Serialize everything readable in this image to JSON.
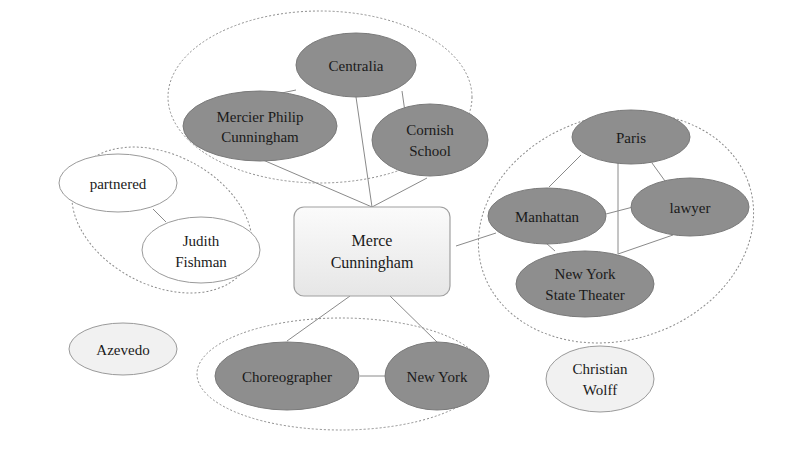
{
  "diagram": {
    "center": {
      "label_line1": "Merce",
      "label_line2": "Cunningham"
    },
    "groups": {
      "top": {
        "nodes": {
          "centralia": {
            "label": "Centralia"
          },
          "mercier": {
            "label_line1": "Mercier Philip",
            "label_line2": "Cunningham"
          },
          "cornish": {
            "label_line1": "Cornish",
            "label_line2": "School"
          }
        }
      },
      "left": {
        "nodes": {
          "partnered": {
            "label": "partnered"
          },
          "judith": {
            "label_line1": "Judith",
            "label_line2": "Fishman"
          }
        }
      },
      "right": {
        "nodes": {
          "paris": {
            "label": "Paris"
          },
          "manhattan": {
            "label": "Manhattan"
          },
          "lawyer": {
            "label": "lawyer"
          },
          "nyst": {
            "label_line1": "New York",
            "label_line2": "State Theater"
          }
        }
      },
      "bottom": {
        "nodes": {
          "choreographer": {
            "label": "Choreographer"
          },
          "newyork": {
            "label": "New York"
          }
        }
      }
    },
    "standalone": {
      "azevedo": {
        "label": "Azevedo"
      },
      "wolff": {
        "label_line1": "Christian",
        "label_line2": "Wolff"
      }
    },
    "colors": {
      "dark_node": "#8e8e8e",
      "light_node": "#ffffff",
      "gray_node": "#f1f1f1",
      "edge": "#8a8a8a"
    }
  }
}
